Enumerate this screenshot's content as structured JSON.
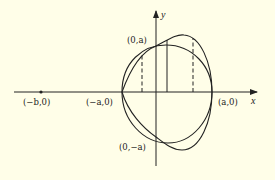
{
  "figure": {
    "axes": {
      "x_label": "x",
      "y_label": "y"
    },
    "points": [
      {
        "id": "neg-b",
        "label": "(−b,0)"
      },
      {
        "id": "neg-a",
        "label": "(−a,0)"
      },
      {
        "id": "pos-a",
        "label": "(a,0)"
      },
      {
        "id": "top",
        "label": "(0,a)"
      },
      {
        "id": "bottom",
        "label": "(0,−a)"
      }
    ],
    "curves": [
      {
        "id": "circle",
        "description": "circle through (±a,0) and (0,±a)"
      },
      {
        "id": "deformed",
        "description": "deformed closed curve bulging to the right"
      }
    ],
    "vertical_segments": [
      {
        "style": "dashed"
      },
      {
        "style": "solid"
      },
      {
        "style": "dashed"
      }
    ],
    "colors": {
      "background": "#fffee8",
      "ink": "#222222"
    }
  }
}
